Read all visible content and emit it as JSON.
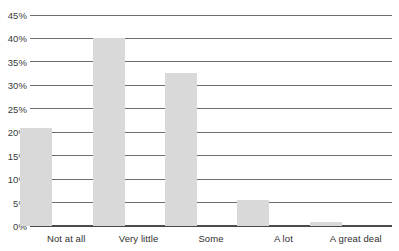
{
  "chart_data": {
    "type": "bar",
    "title": "",
    "subtitle": "",
    "xlabel": "",
    "ylabel": "",
    "categories": [
      "Not at all",
      "Very little",
      "Some",
      "A lot",
      "A great deal"
    ],
    "values": [
      21.0,
      40.0,
      32.7,
      5.6,
      0.9
    ],
    "series": [
      {
        "name": "",
        "values": [
          21.0,
          40.0,
          32.7,
          5.6,
          0.9
        ]
      }
    ],
    "ylim": [
      0,
      45
    ],
    "ytick_values": [
      0,
      5,
      10,
      15,
      20,
      25,
      30,
      35,
      40,
      45
    ],
    "ytick_labels": [
      "0%",
      "5%",
      "10%",
      "15%",
      "20%",
      "25%",
      "30%",
      "35%",
      "40%",
      "45%"
    ],
    "grid": true,
    "grid_axis": "y",
    "legend": false,
    "legend_position": "none",
    "annotations": [],
    "colors": {
      "bar_fill": "#d9d9d9",
      "gridline": "#6d6d6d",
      "axis": "#4a4a4a",
      "tick_label": "#3a3a3a",
      "category_label": "#2f2f2f",
      "background": "#ffffff"
    }
  }
}
